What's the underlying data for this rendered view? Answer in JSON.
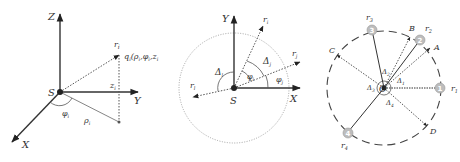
{
  "panels": [
    {
      "id": "cylindrical-coordinates",
      "labels": {
        "z_axis": "Z",
        "y_axis": "Y",
        "x_axis": "X",
        "origin": "S",
        "vector": "r",
        "vector_sub": "i",
        "point": "q",
        "point_sub": "i",
        "point_coords": "(ρ",
        "point_coords_full": "q_i(ρ_i, φ_i, z_i)",
        "z": "z",
        "z_sub": "i",
        "rho": "ρ",
        "rho_sub": "i",
        "phi": "φ",
        "phi_sub": "i"
      }
    },
    {
      "id": "angular-difference",
      "labels": {
        "y_axis": "Y",
        "x_axis": "X",
        "origin": "S",
        "r_i": "r",
        "r_i_sub": "i",
        "r_j": "r",
        "r_j_sub": "j",
        "r_l": "r",
        "r_l_sub": "l",
        "delta_l": "Δ",
        "delta_l_sub": "l",
        "delta_j": "Δ",
        "delta_j_sub": "j",
        "phi_i": "φ",
        "phi_i_sub": "i",
        "phi_j": "φ",
        "phi_j_sub": "j"
      }
    },
    {
      "id": "sector-partition",
      "labels": {
        "center": "O",
        "r1": "r",
        "r1_sub": "1",
        "r2": "r",
        "r2_sub": "2",
        "r3": "r",
        "r3_sub": "3",
        "r4": "r",
        "r4_sub": "4",
        "A": "A",
        "B": "B",
        "C": "C",
        "D": "D",
        "d1": "Δ",
        "d1_sub": "1",
        "d2": "Δ",
        "d2_sub": "2",
        "d3": "Δ",
        "d3_sub": "3",
        "d4": "Δ",
        "d4_sub": "4"
      },
      "nodes": [
        "1",
        "2",
        "3",
        "4"
      ]
    }
  ]
}
